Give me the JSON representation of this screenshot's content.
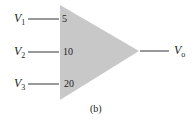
{
  "diagram": {
    "type": "summing-amplifier",
    "fill_color": "#c8c8c8",
    "line_color": "#333333",
    "inputs": [
      {
        "var": "V",
        "sub": "1",
        "gain": "5"
      },
      {
        "var": "V",
        "sub": "2",
        "gain": "10"
      },
      {
        "var": "V",
        "sub": "3",
        "gain": "20"
      }
    ],
    "output": {
      "var": "V",
      "sub": "o"
    },
    "caption": "(b)"
  }
}
